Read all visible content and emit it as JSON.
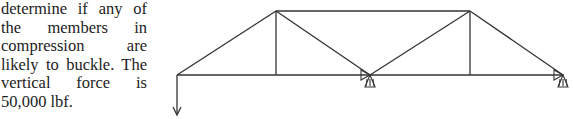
{
  "text": {
    "lines": [
      "determine if any of",
      "the members in",
      "compression are",
      "likely to buckle. The",
      "vertical force is",
      "50,000 lbf."
    ]
  },
  "diagram": {
    "type": "truss",
    "line_color": "#333333",
    "nodes": {
      "A": [
        177,
        75
      ],
      "B": [
        276,
        11
      ],
      "C": [
        276,
        75
      ],
      "D": [
        370,
        75
      ],
      "E": [
        470,
        11
      ],
      "F": [
        470,
        75
      ],
      "G": [
        563,
        75
      ]
    },
    "members": [
      [
        "A",
        "B"
      ],
      [
        "B",
        "E"
      ],
      [
        "A",
        "C"
      ],
      [
        "C",
        "D"
      ],
      [
        "D",
        "F"
      ],
      [
        "F",
        "G"
      ],
      [
        "B",
        "C"
      ],
      [
        "B",
        "D"
      ],
      [
        "D",
        "E"
      ],
      [
        "E",
        "F"
      ],
      [
        "E",
        "G"
      ]
    ],
    "supports": [
      {
        "node": "D",
        "type": "pin"
      },
      {
        "node": "G",
        "type": "pin"
      }
    ],
    "loads": [
      {
        "node": "A",
        "direction": "down",
        "label": "vertical force 50,000 lbf"
      }
    ]
  }
}
